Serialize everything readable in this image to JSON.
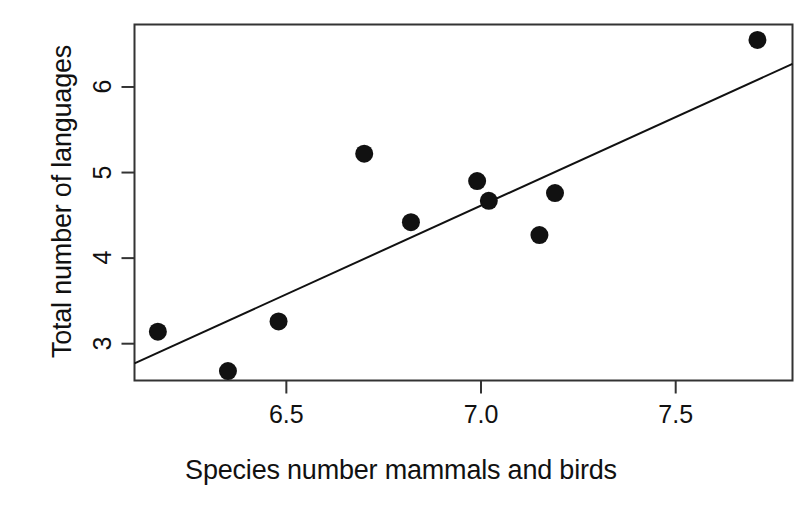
{
  "chart_data": {
    "type": "scatter",
    "title": "",
    "xlabel": "Species number mammals and birds",
    "ylabel": "Total number of languages",
    "xlim": [
      6.11,
      7.8
    ],
    "ylim": [
      2.57,
      6.73
    ],
    "grid": false,
    "legend": null,
    "xticks": [
      "6.5",
      "7.0",
      "7.5"
    ],
    "xtick_values": [
      6.5,
      7.0,
      7.5
    ],
    "yticks": [
      "3",
      "4",
      "5",
      "6"
    ],
    "ytick_values": [
      3,
      4,
      5,
      6
    ],
    "point_color": "#111111",
    "line_color": "#111111",
    "points": [
      {
        "x": 6.17,
        "y": 3.14
      },
      {
        "x": 6.35,
        "y": 2.68
      },
      {
        "x": 6.48,
        "y": 3.26
      },
      {
        "x": 6.7,
        "y": 5.22
      },
      {
        "x": 6.82,
        "y": 4.42
      },
      {
        "x": 6.99,
        "y": 4.9
      },
      {
        "x": 7.02,
        "y": 4.67
      },
      {
        "x": 7.15,
        "y": 4.27
      },
      {
        "x": 7.19,
        "y": 4.76
      },
      {
        "x": 7.71,
        "y": 6.55
      }
    ],
    "series": [
      {
        "name": "observations",
        "x": [
          6.17,
          6.35,
          6.48,
          6.7,
          6.82,
          6.99,
          7.02,
          7.15,
          7.19,
          7.71
        ],
        "values": [
          3.14,
          2.68,
          3.26,
          5.22,
          4.42,
          4.9,
          4.67,
          4.27,
          4.76,
          6.55
        ]
      }
    ],
    "fit_line": {
      "name": "regression line",
      "x_start": 6.11,
      "y_start": 2.77,
      "x_end": 7.8,
      "y_end": 6.27,
      "slope": 2.07,
      "intercept": -9.88
    },
    "annotations": []
  }
}
